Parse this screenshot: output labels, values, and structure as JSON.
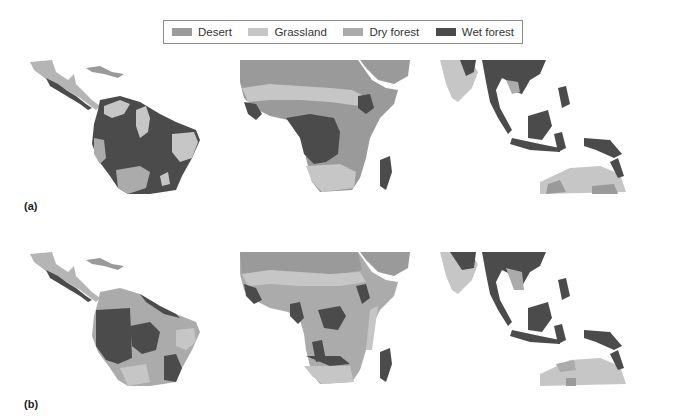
{
  "legend": {
    "items": [
      {
        "label": "Desert",
        "color": "#9a9a9a"
      },
      {
        "label": "Grassland",
        "color": "#c6c6c6"
      },
      {
        "label": "Dry forest",
        "color": "#ababab"
      },
      {
        "label": "Wet forest",
        "color": "#4b4b4b"
      }
    ]
  },
  "panels": [
    {
      "label": "(a)",
      "regions": [
        "Central & South America",
        "Africa",
        "South & Southeast Asia / Australia"
      ],
      "dominant": "Wet forest covers Amazon and Congo basins"
    },
    {
      "label": "(b)",
      "regions": [
        "Central & South America",
        "Africa",
        "South & Southeast Asia / Australia"
      ],
      "dominant": "Dry forest expands; wet forest contracts to patches"
    }
  ],
  "colors": {
    "desert": "#9a9a9a",
    "grassland": "#c6c6c6",
    "dry_forest": "#ababab",
    "wet_forest": "#4b4b4b",
    "background": "#ffffff",
    "legend_border": "#8a8a8a"
  }
}
